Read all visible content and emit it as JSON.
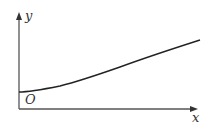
{
  "diagram": {
    "type": "function-sketch",
    "axes": {
      "x_label": "x",
      "y_label": "y",
      "origin_label": "O"
    },
    "curve": {
      "description": "increasing curve starting on positive y-axis, gently concave up then nearly linear",
      "points": [
        [
          19,
          92
        ],
        [
          30,
          91
        ],
        [
          60,
          86
        ],
        [
          100,
          73
        ],
        [
          140,
          60
        ],
        [
          170,
          50
        ],
        [
          200,
          40
        ]
      ]
    },
    "colors": {
      "axis": "#555555",
      "curve": "#222222",
      "label": "#333333"
    }
  }
}
